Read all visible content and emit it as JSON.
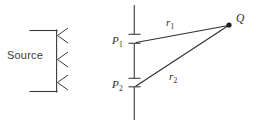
{
  "figure": {
    "title": "",
    "background_color": "#ffffff",
    "stroke_color": "#3a3a3a",
    "labels": {
      "source": "Source",
      "point_1": "P",
      "point_1_sub": "1",
      "point_2": "P",
      "point_2_sub": "2",
      "ray_1": "r",
      "ray_1_sub": "1",
      "ray_2": "r",
      "ray_2_sub": "2",
      "field_point": "Q"
    },
    "elements": {
      "source_bracket": "source-emitter-bracket",
      "emission_arrows": 3,
      "slit_line": "vertical-barrier-line",
      "aperture_ticks": 4,
      "field_point_dot": "filled-dot"
    },
    "geometry": {
      "barrier_x": 134,
      "barrier_top_y": 5,
      "barrier_bottom_y": 120,
      "p1_y": 43,
      "p2_y": 86,
      "q_x": 229,
      "q_y": 25
    }
  }
}
